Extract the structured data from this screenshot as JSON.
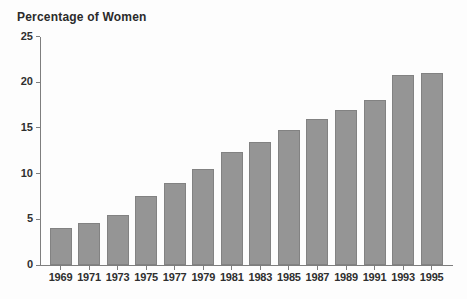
{
  "chart_data": {
    "type": "bar",
    "title": "Percentage of Women",
    "categories": [
      "1969",
      "1971",
      "1973",
      "1975",
      "1977",
      "1979",
      "1981",
      "1983",
      "1985",
      "1987",
      "1989",
      "1991",
      "1993",
      "1995"
    ],
    "values": [
      4.1,
      4.6,
      5.5,
      7.5,
      9.0,
      10.5,
      12.4,
      13.5,
      14.8,
      16.0,
      17.0,
      18.0,
      20.8,
      21.0
    ],
    "xlabel": "",
    "ylabel": "Percentage of Women",
    "ylim": [
      0,
      25
    ],
    "yticks": [
      0,
      5,
      10,
      15,
      20,
      25
    ],
    "grid": false,
    "legend": "none",
    "bar_color": "#959595",
    "bar_border_color": "#828282",
    "axis_color": "#7e7e7e",
    "text_color": "#2f2f2f",
    "background_color": "#fdfdfd"
  }
}
